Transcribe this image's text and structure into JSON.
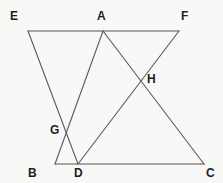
{
  "figure": {
    "width": 223,
    "height": 183,
    "background_color": "#f8f8f6",
    "baseline_color": "#8a8a8a",
    "edge_color": "#5a5a5a",
    "label_color": "#1f1f1f"
  },
  "diagram_type": "geometry-line-figure",
  "points": {
    "E": {
      "label": "E",
      "x": 28,
      "y": 31,
      "label_x": 10,
      "label_y": 10
    },
    "A": {
      "label": "A",
      "x": 103,
      "y": 31,
      "label_x": 97,
      "label_y": 10
    },
    "F": {
      "label": "F",
      "x": 179,
      "y": 31,
      "label_x": 181,
      "label_y": 10
    },
    "G": {
      "label": "G",
      "x": 70,
      "y": 130,
      "label_x": 50,
      "label_y": 124
    },
    "H": {
      "label": "H",
      "x": 143,
      "y": 79,
      "label_x": 147,
      "label_y": 73
    },
    "B": {
      "label": "B",
      "x": 55,
      "y": 164,
      "label_x": 28,
      "label_y": 167
    },
    "D": {
      "label": "D",
      "x": 78,
      "y": 164,
      "label_x": 74,
      "label_y": 167
    },
    "C": {
      "label": "C",
      "x": 204,
      "y": 164,
      "label_x": 206,
      "label_y": 167
    }
  },
  "segments": [
    {
      "name": "EF",
      "from": "E",
      "to": "F",
      "style": "baseline"
    },
    {
      "name": "BC",
      "from": "B",
      "to": "C",
      "style": "baseline"
    },
    {
      "name": "ED",
      "from": "E",
      "to": "D",
      "style": "edge"
    },
    {
      "name": "BA",
      "from": "B",
      "to": "A",
      "style": "edge"
    },
    {
      "name": "AC",
      "from": "A",
      "to": "C",
      "style": "edge"
    },
    {
      "name": "FD",
      "from": "F",
      "to": "D",
      "style": "edge"
    }
  ],
  "intersections": [
    {
      "name": "G",
      "of": [
        "ED",
        "BA"
      ]
    },
    {
      "name": "H",
      "of": [
        "AC",
        "FD"
      ]
    }
  ]
}
